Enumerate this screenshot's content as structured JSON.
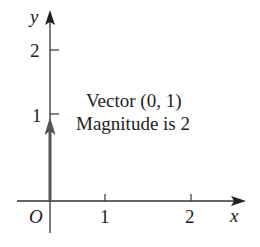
{
  "diagram": {
    "type": "vector-plot",
    "axes": {
      "x_label": "x",
      "y_label": "y",
      "origin_label": "O",
      "x_ticks": [
        "1",
        "2"
      ],
      "y_ticks": [
        "1",
        "2"
      ]
    },
    "vector": {
      "components": [
        0,
        1
      ],
      "color": "#555555"
    },
    "annotation": {
      "line1": "Vector (0, 1)",
      "line2": "Magnitude is 2"
    },
    "colors": {
      "axis": "#333333",
      "text": "#222222",
      "background": "#ffffff"
    }
  }
}
